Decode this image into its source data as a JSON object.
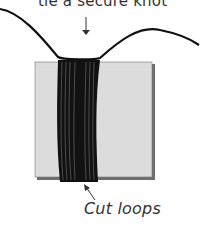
{
  "diagram": {
    "top_label": "tie a secure knot",
    "bottom_label": "Cut loops",
    "colors": {
      "card_fill": "#dcdcdc",
      "card_edge": "#6e6e6e",
      "yarn": "#111111",
      "arrow": "#333333",
      "text": "#333333"
    }
  }
}
